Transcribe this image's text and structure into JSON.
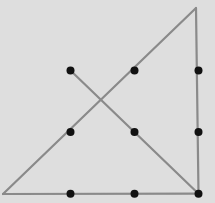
{
  "diagram": {
    "colors": {
      "background": "#dedede",
      "line": "#8a8a8a",
      "dot": "#111111"
    },
    "grid": {
      "rows": 3,
      "cols": 3,
      "dots": [
        {
          "row": 0,
          "col": 0
        },
        {
          "row": 0,
          "col": 1
        },
        {
          "row": 0,
          "col": 2
        },
        {
          "row": 1,
          "col": 0
        },
        {
          "row": 1,
          "col": 1
        },
        {
          "row": 1,
          "col": 2
        },
        {
          "row": 2,
          "col": 0
        },
        {
          "row": 2,
          "col": 1
        },
        {
          "row": 2,
          "col": 2
        }
      ]
    },
    "path": {
      "description": "Four connected straight lines passing through all nine dots",
      "vertices_grid_units": [
        {
          "col": 0,
          "row": 0
        },
        {
          "col": 2,
          "row": 2
        },
        {
          "col": 2,
          "row": -1
        },
        {
          "col": -1,
          "row": 2
        },
        {
          "col": 2,
          "row": 2
        }
      ],
      "segment_count": 4
    }
  }
}
